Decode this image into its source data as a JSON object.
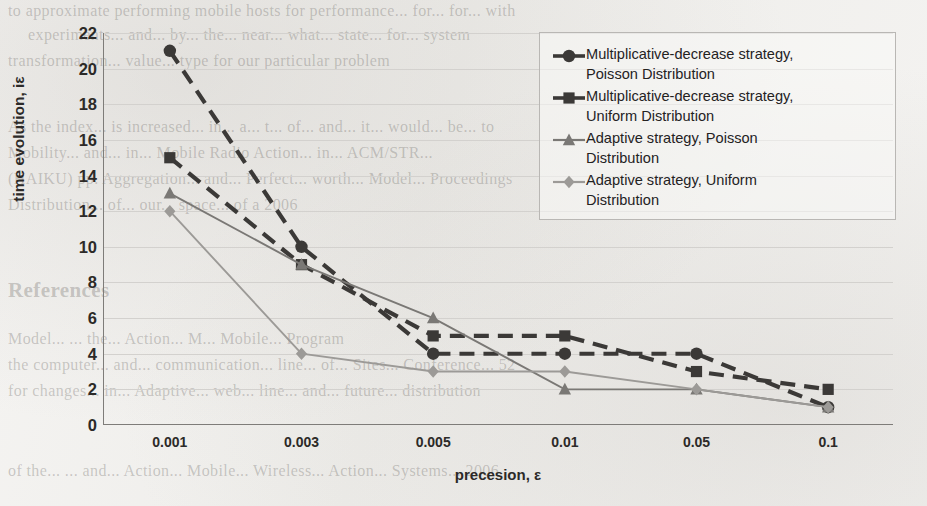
{
  "chart_data": {
    "type": "line",
    "title": "",
    "xlabel": "precesion, ε",
    "ylabel": "time evolution, iε",
    "categories": [
      "0.001",
      "0.003",
      "0.005",
      "0.01",
      "0.05",
      "0.1"
    ],
    "ylim": [
      0,
      22
    ],
    "ytick_step": 2,
    "yticks": [
      "22",
      "20",
      "18",
      "16",
      "14",
      "12",
      "10",
      "8",
      "6",
      "4",
      "2",
      "0"
    ],
    "grid": "horizontal",
    "legend_position": "top-right inside plot",
    "series": [
      {
        "name": "Multiplicative-decrease strategy, Poisson Distribution",
        "label_lines": "Multiplicative-decrease strategy,\nPoisson Distribution",
        "marker": "circle",
        "line_style": "dashed",
        "color": "#3b3937",
        "values": [
          21,
          10,
          4,
          4,
          4,
          1
        ]
      },
      {
        "name": "Multiplicative-decrease strategy, Uniform Distribution",
        "label_lines": "Multiplicative-decrease strategy,\nUniform Distribution",
        "marker": "square",
        "line_style": "dashed",
        "color": "#3b3937",
        "values": [
          15,
          9,
          5,
          5,
          3,
          2
        ]
      },
      {
        "name": "Adaptive strategy, Poisson Distribution",
        "label_lines": "Adaptive strategy, Poisson\nDistribution",
        "marker": "triangle",
        "line_style": "solid",
        "color": "#7a7875",
        "values": [
          13,
          9,
          6,
          2,
          2,
          1
        ]
      },
      {
        "name": "Adaptive strategy, Uniform Distribution",
        "label_lines": "Adaptive strategy, Uniform\nDistribution",
        "marker": "diamond",
        "line_style": "solid",
        "color": "#9c9a97",
        "values": [
          12,
          4,
          3,
          3,
          2,
          1
        ]
      }
    ]
  },
  "bleed_through": {
    "lines": [
      "to approximate performing mobile hosts for performance... for... for... with",
      "experiments... and... by... the... near... what... state... for... system",
      "transformation... value... type for our particular problem",
      "As the index... is increased... in... a... t... of... and... it... would... be... to",
      "Mobility... and... in... Mobile Radio Action... in... ACM/STR...",
      "(HAIKU) pp. Aggregation... and... Perfect... worth... Model... Proceedings",
      "Distribution... of... our... space... of a 2006",
      "References",
      "Model... ... the... Action... M... Mobile... Program",
      "the computer... and... communication... line... of... Sites... Conference... 52",
      "for changes... in... Adaptive... web... line... and... future... distribution",
      "of the... ... and... Action... Mobile... Wireless... Action... Systems... 2006"
    ]
  }
}
